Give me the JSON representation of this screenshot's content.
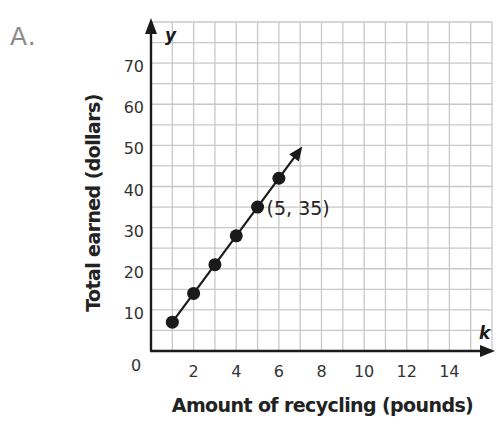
{
  "problem": {
    "label": "A."
  },
  "chart_data": {
    "type": "line",
    "title": "",
    "xlabel": "Amount of recycling (pounds)",
    "ylabel": "Total earned (dollars)",
    "x_axis_variable": "k",
    "y_axis_variable": "y",
    "xlim": [
      0,
      16
    ],
    "ylim": [
      0,
      80
    ],
    "x_ticks": [
      2,
      4,
      6,
      8,
      10,
      12,
      14
    ],
    "x_tick_labels": [
      "2",
      "4",
      "6",
      "8",
      "10",
      "12",
      "14"
    ],
    "y_ticks": [
      10,
      20,
      30,
      40,
      50,
      60,
      70
    ],
    "y_tick_labels": [
      "10",
      "20",
      "30",
      "40",
      "50",
      "60",
      "70"
    ],
    "origin_label": "0",
    "grid": true,
    "grid_x_step": 1,
    "grid_y_step": 5,
    "legend": null,
    "series": [
      {
        "name": "Total earned",
        "x": [
          1,
          2,
          3,
          4,
          5,
          6
        ],
        "y": [
          7,
          14,
          21,
          28,
          35,
          42
        ],
        "markers": true,
        "arrow_end": [
          7.1,
          49.7
        ]
      }
    ],
    "annotations": [
      {
        "text": "(5, 35)",
        "x": 5,
        "y": 35
      }
    ]
  },
  "colors": {
    "grid": "#c8c8c8",
    "axis": "#1a1a1a",
    "line": "#1a1a1a",
    "marker": "#1a1a1a",
    "tick_text": "#333333",
    "problem_label": "#8a8a8a"
  }
}
